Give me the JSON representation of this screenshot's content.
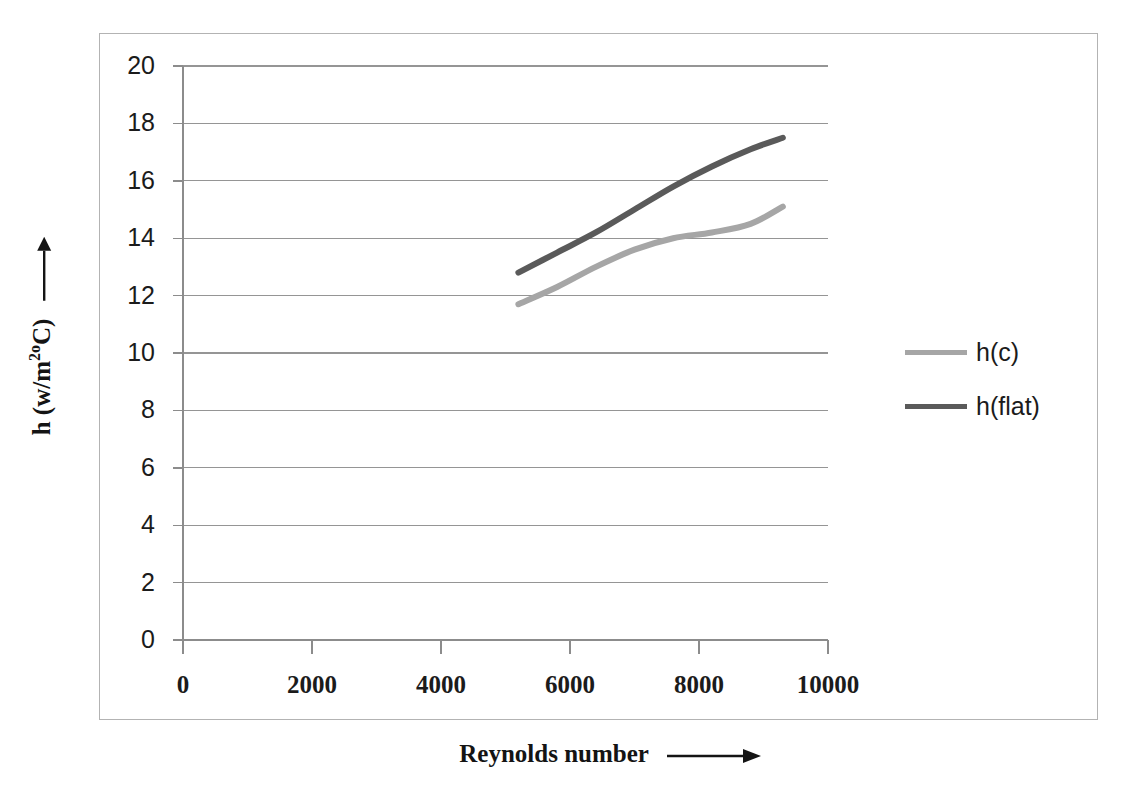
{
  "chart_data": {
    "type": "line",
    "title": "",
    "xlabel": "Reynolds number",
    "ylabel": "h  (w/m2oC)",
    "xlabel_arrow": "right-arrow",
    "ylabel_arrow": "up-arrow",
    "xlim": [
      0,
      10000
    ],
    "ylim": [
      0,
      20
    ],
    "xticks": [
      "0",
      "2000",
      "4000",
      "6000",
      "8000",
      "10000"
    ],
    "xtick_values": [
      0,
      2000,
      4000,
      6000,
      8000,
      10000
    ],
    "yticks": [
      "0",
      "2",
      "4",
      "6",
      "8",
      "10",
      "12",
      "14",
      "16",
      "18",
      "20"
    ],
    "ytick_values": [
      0,
      2,
      4,
      6,
      8,
      10,
      12,
      14,
      16,
      18,
      20
    ],
    "grid": "horizontal",
    "legend_position": "right",
    "series": [
      {
        "name": "h(c)",
        "color": "#a6a6a6",
        "x": [
          5200,
          5800,
          6400,
          7000,
          7600,
          8200,
          8800,
          9300
        ],
        "values": [
          11.7,
          12.3,
          13.0,
          13.6,
          14.0,
          14.2,
          14.5,
          15.1
        ]
      },
      {
        "name": "h(flat)",
        "color": "#5a5a5a",
        "x": [
          5200,
          5800,
          6400,
          7000,
          7600,
          8200,
          8800,
          9300
        ],
        "values": [
          12.8,
          13.5,
          14.2,
          15.0,
          15.8,
          16.5,
          17.1,
          17.5
        ]
      }
    ]
  },
  "legend": {
    "items": [
      {
        "label": "h(c)",
        "color": "#a6a6a6"
      },
      {
        "label": "h(flat)",
        "color": "#5a5a5a"
      }
    ]
  },
  "axes": {
    "y_title_main": "h  (w/m",
    "y_title_sup": "2o",
    "y_title_tail": "C)",
    "x_title": "Reynolds number"
  },
  "colors": {
    "frame": "#b3b3b3",
    "grid": "#959595",
    "axis": "#8c8c8c",
    "text": "#1b1b1b",
    "series_light": "#a6a6a6",
    "series_dark": "#5a5a5a",
    "background": "#ffffff"
  }
}
